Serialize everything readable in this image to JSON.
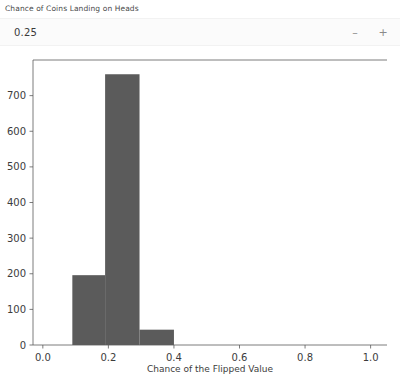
{
  "widget": {
    "label": "Chance of Coins Landing on Heads",
    "value": "0.25",
    "decrement_label": "–",
    "increment_label": "+"
  },
  "chart_data": {
    "type": "bar",
    "title": "",
    "xlabel": "Chance of the Flipped Value",
    "ylabel": "",
    "xlim": [
      -0.03,
      1.05
    ],
    "ylim": [
      0,
      800
    ],
    "grid": false,
    "legend": null,
    "bar_color": "#5b5b5b",
    "bin_edges": [
      0.09,
      0.19,
      0.295,
      0.4
    ],
    "categories": [
      "0.09-0.19",
      "0.19-0.30",
      "0.30-0.40"
    ],
    "values": [
      196,
      760,
      43
    ],
    "xticks": [
      "0.0",
      "0.2",
      "0.4",
      "0.6",
      "0.8",
      "1.0"
    ],
    "xtick_values": [
      0.0,
      0.2,
      0.4,
      0.6,
      0.8,
      1.0
    ],
    "yticks": [
      "0",
      "100",
      "200",
      "300",
      "400",
      "500",
      "600",
      "700"
    ],
    "ytick_values": [
      0,
      100,
      200,
      300,
      400,
      500,
      600,
      700
    ]
  }
}
